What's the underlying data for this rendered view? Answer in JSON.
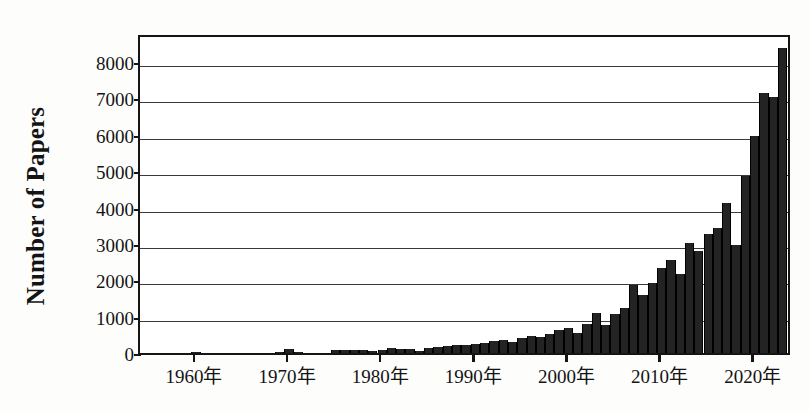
{
  "chart_data": {
    "type": "bar",
    "title": "",
    "subtitle": "",
    "xlabel": "",
    "ylabel": "Number of Papers",
    "xlim": [
      1954,
      2024
    ],
    "ylim": [
      0,
      8800
    ],
    "grid": true,
    "legend": null,
    "y_ticks": [
      0,
      1000,
      2000,
      3000,
      4000,
      5000,
      6000,
      7000,
      8000
    ],
    "y_tick_labels": [
      "0",
      "1000",
      "2000",
      "3000",
      "4000",
      "5000",
      "6000",
      "7000",
      "8000"
    ],
    "x_ticks": [
      1960,
      1970,
      1980,
      1990,
      2000,
      2010,
      2020
    ],
    "x_tick_labels": [
      "1960年",
      "1970年",
      "1980年",
      "1990年",
      "2000年",
      "2010年",
      "2020年"
    ],
    "bar_color": "#232323",
    "axis_color": "#151515",
    "grid_color": "#3a3a3a",
    "categories": [
      1955,
      1956,
      1957,
      1958,
      1959,
      1960,
      1961,
      1962,
      1963,
      1964,
      1965,
      1966,
      1967,
      1968,
      1969,
      1970,
      1971,
      1972,
      1973,
      1974,
      1975,
      1976,
      1977,
      1978,
      1979,
      1980,
      1981,
      1982,
      1983,
      1984,
      1985,
      1986,
      1987,
      1988,
      1989,
      1990,
      1991,
      1992,
      1993,
      1994,
      1995,
      1996,
      1997,
      1998,
      1999,
      2000,
      2001,
      2002,
      2003,
      2004,
      2005,
      2006,
      2007,
      2008,
      2009,
      2010,
      2011,
      2012,
      2013,
      2014,
      2015,
      2016,
      2017,
      2018,
      2019,
      2020,
      2021,
      2022,
      2023
    ],
    "values": [
      0,
      0,
      0,
      0,
      0,
      40,
      0,
      0,
      0,
      0,
      0,
      0,
      0,
      0,
      25,
      110,
      30,
      0,
      0,
      0,
      70,
      80,
      70,
      70,
      60,
      95,
      130,
      110,
      100,
      60,
      140,
      155,
      190,
      230,
      215,
      240,
      270,
      340,
      350,
      300,
      420,
      470,
      430,
      520,
      620,
      700,
      560,
      790,
      1110,
      760,
      1060,
      1240,
      1870,
      1590,
      1930,
      2350,
      2560,
      2170,
      3030,
      2800,
      3260,
      3430,
      4130,
      2960,
      4880,
      5960,
      7140,
      7040,
      8400
    ],
    "series_name": "Papers per year",
    "bar_width_years": 1.0
  }
}
